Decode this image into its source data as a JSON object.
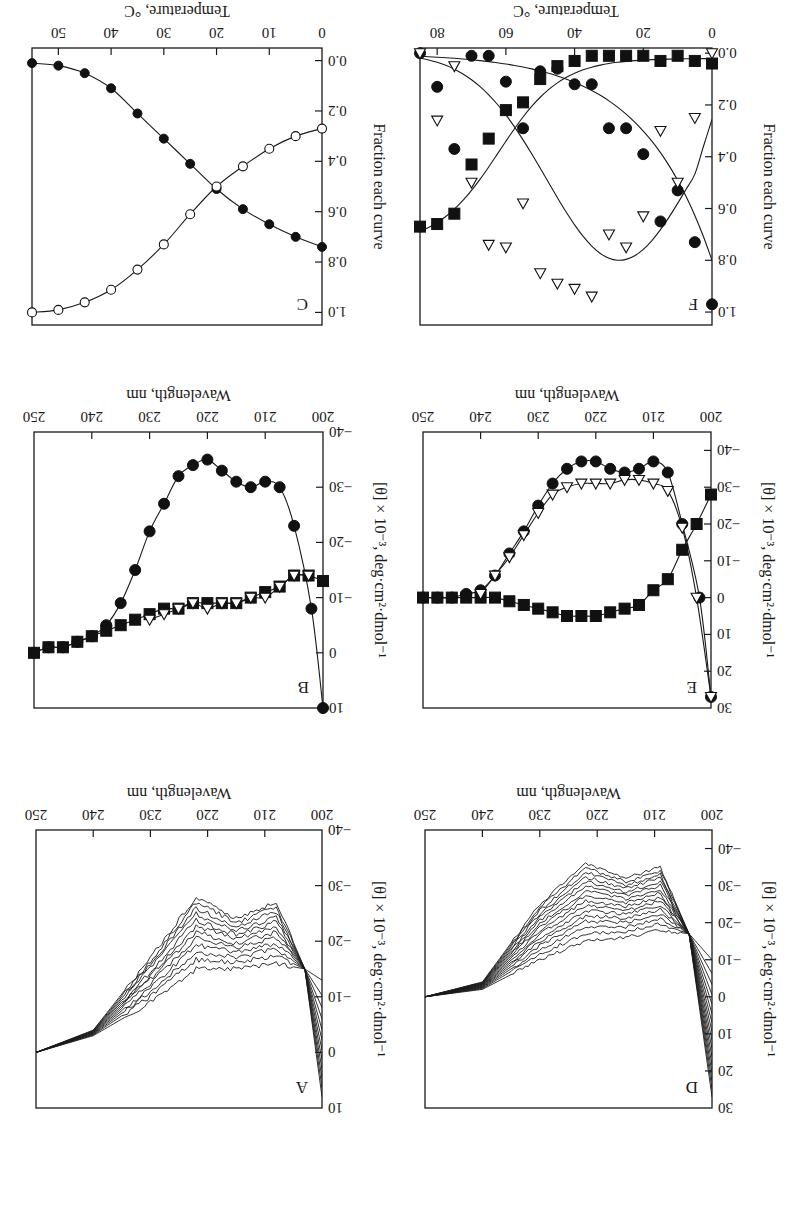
{
  "figure": {
    "layout": "2 rows x 3 columns, image rotated 180 degrees",
    "rotation_deg": 180,
    "colors": {
      "ink": "#1a1a1a",
      "background": "#ffffff"
    }
  },
  "chart_data": [
    {
      "panel": "A",
      "type": "line",
      "title": "",
      "panel_label": "A",
      "xlabel": "Wavelength, nm",
      "ylabel": "[θ] × 10⁻³, deg·cm²·dmol⁻¹",
      "xlim": [
        200,
        250
      ],
      "ylim": [
        -40,
        10
      ],
      "xticks": [
        200,
        210,
        220,
        230,
        240,
        250
      ],
      "yticks": [
        10,
        0,
        -10,
        -20,
        -30,
        -40
      ],
      "description": "Family of ~12 temperature-dependent CD spectra; isodichroic point near 203 nm (~-15); minima near 208 and 222 nm deepening from ~-15 to ~-28",
      "series": [
        {
          "name": "spectrum_1 (least helical)",
          "x": [
            200,
            203,
            208,
            215,
            222,
            230,
            240,
            250
          ],
          "y": [
            -13,
            -15,
            -16,
            -15,
            -15,
            -9,
            -3,
            0
          ]
        },
        {
          "name": "spectrum_mid",
          "x": [
            200,
            203,
            208,
            215,
            222,
            230,
            240,
            250
          ],
          "y": [
            -2,
            -15,
            -21,
            -20,
            -21,
            -12,
            -3,
            0
          ]
        },
        {
          "name": "spectrum_12 (most helical)",
          "x": [
            200,
            203,
            208,
            215,
            222,
            230,
            240,
            250
          ],
          "y": [
            8,
            -15,
            -27,
            -24,
            -28,
            -17,
            -4,
            0
          ]
        }
      ],
      "grid": false
    },
    {
      "panel": "B",
      "type": "scatter",
      "panel_label": "B",
      "xlabel": "Wavelength, nm",
      "ylabel": "[θ] × 10⁻³, deg·cm²·dmol⁻¹",
      "xlim": [
        200,
        250
      ],
      "ylim": [
        -40,
        10
      ],
      "xticks": [
        200,
        210,
        220,
        230,
        240,
        250
      ],
      "yticks": [
        10,
        0,
        -10,
        -20,
        -30,
        -40
      ],
      "series": [
        {
          "name": "filled circles (helix basis)",
          "marker": "filled-circle",
          "x": [
            200,
            202,
            205,
            207.5,
            210,
            212.5,
            215,
            217.5,
            220,
            222.5,
            225,
            227.5,
            230,
            232.5,
            235,
            237.5,
            240,
            242.5,
            245,
            247.5,
            250
          ],
          "y": [
            10,
            -8,
            -23,
            -30,
            -31,
            -30,
            -31,
            -33,
            -35,
            -34,
            -32,
            -27,
            -22,
            -15,
            -9,
            -5,
            -3,
            -2,
            -1,
            -1,
            0
          ]
        },
        {
          "name": "filled squares (coil basis)",
          "marker": "filled-square",
          "x": [
            200,
            202.5,
            205,
            207.5,
            210,
            212.5,
            215,
            217.5,
            220,
            222.5,
            225,
            227.5,
            230,
            232.5,
            235,
            237.5,
            240,
            242.5,
            245,
            247.5,
            250
          ],
          "y": [
            -13,
            -14,
            -14,
            -12,
            -11,
            -10,
            -9,
            -9,
            -9,
            -9,
            -8,
            -8,
            -7,
            -6,
            -5,
            -4,
            -3,
            -2,
            -1,
            -1,
            0
          ]
        },
        {
          "name": "open triangles (intermediate basis)",
          "marker": "open-triangle",
          "x": [
            202.5,
            205,
            207.5,
            210,
            212.5,
            215,
            217.5,
            220,
            222.5,
            225,
            227.5,
            230
          ],
          "y": [
            -14,
            -14,
            -12,
            -10,
            -10,
            -9,
            -9,
            -8,
            -9,
            -8,
            -7,
            -6
          ]
        }
      ],
      "grid": false
    },
    {
      "panel": "C",
      "type": "scatter",
      "panel_label": "C",
      "xlabel": "Temperature, °C",
      "ylabel": "Fraction each curve",
      "xlim": [
        0,
        55
      ],
      "ylim": [
        -0.05,
        1.05
      ],
      "xticks": [
        0,
        10,
        20,
        30,
        40,
        50
      ],
      "yticks": [
        1.0,
        0.8,
        0.6,
        0.4,
        0.2,
        0.0
      ],
      "series": [
        {
          "name": "filled circles (helix fraction)",
          "marker": "filled-circle",
          "x": [
            0,
            5,
            10,
            15,
            20,
            25,
            30,
            35,
            40,
            45,
            50,
            55
          ],
          "y": [
            0.74,
            0.7,
            0.65,
            0.59,
            0.51,
            0.41,
            0.31,
            0.21,
            0.11,
            0.05,
            0.02,
            0.01
          ]
        },
        {
          "name": "open circles (coil fraction)",
          "marker": "open-circle",
          "x": [
            0,
            5,
            10,
            15,
            20,
            25,
            30,
            35,
            40,
            45,
            50,
            55
          ],
          "y": [
            0.27,
            0.3,
            0.35,
            0.42,
            0.5,
            0.61,
            0.73,
            0.83,
            0.91,
            0.96,
            0.99,
            1.0
          ]
        }
      ],
      "grid": false
    },
    {
      "panel": "D",
      "type": "line",
      "panel_label": "D",
      "xlabel": "Wavelength, nm",
      "ylabel": "[θ] × 10⁻³, deg·cm²·dmol⁻¹",
      "xlim": [
        200,
        250
      ],
      "ylim": [
        -45,
        30
      ],
      "xticks": [
        200,
        210,
        220,
        230,
        240,
        250
      ],
      "yticks": [
        30,
        20,
        10,
        0,
        -10,
        -20,
        -30,
        -40
      ],
      "description": "Family of ~16 CD spectra; isodichroic point near 204 nm (~-17); minima at 209 and 222 nm deepening to ~-36",
      "series": [
        {
          "name": "spectrum_1 (least helical)",
          "x": [
            200,
            204,
            209,
            215,
            222,
            230,
            240,
            250
          ],
          "y": [
            -10,
            -17,
            -18,
            -16,
            -15,
            -10,
            -2,
            0
          ]
        },
        {
          "name": "spectrum_mid",
          "x": [
            200,
            204,
            209,
            215,
            222,
            230,
            240,
            250
          ],
          "y": [
            8,
            -17,
            -27,
            -25,
            -26,
            -16,
            -3,
            0
          ]
        },
        {
          "name": "spectrum_16 (most helical)",
          "x": [
            200,
            204,
            209,
            215,
            222,
            230,
            240,
            250
          ],
          "y": [
            27,
            -17,
            -35,
            -32,
            -36,
            -25,
            -4,
            0
          ]
        }
      ],
      "grid": false
    },
    {
      "panel": "E",
      "type": "scatter",
      "panel_label": "E",
      "xlabel": "Wavelength, nm",
      "ylabel": "[θ] × 10⁻³, deg·cm²·dmol⁻¹",
      "xlim": [
        200,
        250
      ],
      "ylim": [
        -45,
        30
      ],
      "xticks": [
        200,
        210,
        220,
        230,
        240,
        250
      ],
      "yticks": [
        30,
        20,
        10,
        0,
        -10,
        -20,
        -30,
        -40
      ],
      "series": [
        {
          "name": "filled circles (helix basis)",
          "marker": "filled-circle",
          "x": [
            200,
            202,
            205,
            207.5,
            210,
            212.5,
            215,
            217.5,
            220,
            222.5,
            225,
            227.5,
            230,
            232.5,
            235,
            237.5,
            240,
            242.5,
            245,
            247.5,
            250
          ],
          "y": [
            27,
            0,
            -20,
            -34,
            -37,
            -35,
            -34,
            -35,
            -37,
            -37,
            -35,
            -31,
            -25,
            -18,
            -12,
            -6,
            -2,
            -1,
            0,
            0,
            0
          ]
        },
        {
          "name": "filled squares (coil basis)",
          "marker": "filled-square",
          "x": [
            200,
            202.5,
            205,
            207.5,
            210,
            212.5,
            215,
            217.5,
            220,
            222.5,
            225,
            227.5,
            230,
            232.5,
            235,
            237.5,
            240,
            242.5,
            245,
            247.5,
            250
          ],
          "y": [
            -28,
            -20,
            -13,
            -5,
            -2,
            2,
            3,
            4,
            5,
            5,
            5,
            4,
            3,
            2,
            1,
            0,
            0,
            0,
            0,
            0,
            0
          ]
        },
        {
          "name": "open triangles (intermediate basis)",
          "marker": "open-triangle",
          "x": [
            200,
            202.5,
            205,
            207.5,
            210,
            212.5,
            215,
            217.5,
            220,
            222.5,
            225,
            227.5,
            230,
            232.5,
            235,
            237.5,
            240
          ],
          "y": [
            27,
            0,
            -19,
            -29,
            -31,
            -32,
            -32,
            -31,
            -31,
            -31,
            -30,
            -28,
            -23,
            -17,
            -11,
            -6,
            -1
          ]
        }
      ],
      "grid": false
    },
    {
      "panel": "F",
      "type": "scatter",
      "panel_label": "F",
      "xlabel": "Temperature, °C",
      "ylabel": "Fraction each curve",
      "xlim": [
        0,
        85
      ],
      "ylim": [
        -0.02,
        1.05
      ],
      "xticks": [
        0,
        20,
        40,
        60,
        80
      ],
      "yticks": [
        1.0,
        0.8,
        0.6,
        0.4,
        0.2,
        0.0
      ],
      "series": [
        {
          "name": "filled circles (helix fraction, decreasing)",
          "marker": "filled-circle",
          "x": [
            0,
            5,
            10,
            15,
            20,
            25,
            30,
            35,
            40,
            45,
            50,
            55,
            60,
            65,
            70,
            75,
            80,
            85
          ],
          "y": [
            0.97,
            0.73,
            0.53,
            0.65,
            0.39,
            0.29,
            0.29,
            0.12,
            0.12,
            0.06,
            0.07,
            0.29,
            0.11,
            0.01,
            0.01,
            0.37,
            0.13,
            0.0
          ]
        },
        {
          "name": "open triangles (intermediate fraction)",
          "marker": "open-triangle",
          "x": [
            0,
            5,
            10,
            15,
            20,
            25,
            30,
            35,
            40,
            45,
            50,
            55,
            60,
            65,
            70,
            75,
            80,
            85
          ],
          "y": [
            0.0,
            0.25,
            0.5,
            0.3,
            0.63,
            0.75,
            0.7,
            0.94,
            0.91,
            0.89,
            0.85,
            0.58,
            0.75,
            0.74,
            0.5,
            0.05,
            0.26,
            0.0
          ]
        },
        {
          "name": "filled squares (coil fraction, increasing)",
          "marker": "filled-square",
          "x": [
            0,
            5,
            10,
            15,
            20,
            25,
            30,
            35,
            40,
            45,
            50,
            55,
            60,
            65,
            70,
            75,
            80,
            85
          ],
          "y": [
            0.04,
            0.03,
            0.01,
            0.03,
            0.01,
            0.01,
            0.01,
            0.01,
            0.03,
            0.05,
            0.1,
            0.19,
            0.22,
            0.33,
            0.43,
            0.62,
            0.66,
            0.67
          ]
        }
      ],
      "curves": [
        {
          "name": "helix fit",
          "shape": "decreasing from 0.8 at 0 to ~0 at 85"
        },
        {
          "name": "intermediate fit",
          "shape": "bell, peak ~0.8 at ~25 °C"
        },
        {
          "name": "coil fit",
          "shape": "sigmoid rising to ~0.7 at 85"
        }
      ],
      "grid": false
    }
  ],
  "labels": {
    "panelA": {
      "letter": "A",
      "xlabel": "Wavelength, nm",
      "ylabel": "[θ] × 10⁻³, deg·cm²·dmol⁻¹"
    },
    "panelB": {
      "letter": "B",
      "xlabel": "Wavelength, nm",
      "ylabel": "[θ] × 10⁻³, deg·cm²·dmol⁻¹"
    },
    "panelC": {
      "letter": "C",
      "xlabel": "Temperature, °C",
      "ylabel": "Fraction each curve"
    },
    "panelD": {
      "letter": "D",
      "xlabel": "Wavelength, nm",
      "ylabel": "[θ] × 10⁻³, deg·cm²·dmol⁻¹"
    },
    "panelE": {
      "letter": "E",
      "xlabel": "Wavelength, nm",
      "ylabel": "[θ] × 10⁻³, deg·cm²·dmol⁻¹"
    },
    "panelF": {
      "letter": "F",
      "xlabel": "Temperature, °C",
      "ylabel": "Fraction each curve"
    }
  }
}
